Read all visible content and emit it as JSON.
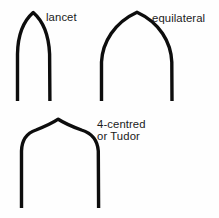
{
  "diagram": {
    "background_color": "#fefefe",
    "stroke_color": "#0d0d0d",
    "text_color": "#1a1a1a",
    "arches": [
      {
        "id": "lancet",
        "label": "lancet",
        "description": "narrow steeply pointed two-centred arch",
        "apex_x": 33,
        "apex_y": 12,
        "span_left_x": 17,
        "span_right_x": 50,
        "base_y": 101
      },
      {
        "id": "equilateral",
        "label": "equilateral",
        "description": "wide two-centred arch whose centres lie at the springing points",
        "apex_x": 137,
        "apex_y": 12,
        "span_left_x": 101,
        "span_right_x": 172,
        "base_y": 101
      },
      {
        "id": "four-centred",
        "label_line_1": "4-centred",
        "label_line_2": "or Tudor",
        "description": "flattened four-centred arch with a low apex",
        "apex_x": 58,
        "apex_y": 119,
        "span_left_x": 21,
        "span_right_x": 99,
        "base_y": 208
      }
    ]
  }
}
